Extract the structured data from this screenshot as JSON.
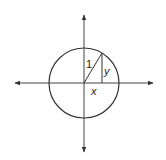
{
  "diagram": {
    "labels": {
      "hypotenuse": "1",
      "opposite": "y",
      "adjacent": "x"
    },
    "geometry": {
      "center": [
        84,
        83
      ],
      "radius": 35,
      "point_on_circle": [
        102,
        53
      ],
      "x_axis": {
        "from": 14,
        "to": 154
      },
      "y_axis": {
        "from": 14,
        "to": 153
      }
    },
    "colors": {
      "stroke": "#333333",
      "background": "#ffffff"
    }
  }
}
